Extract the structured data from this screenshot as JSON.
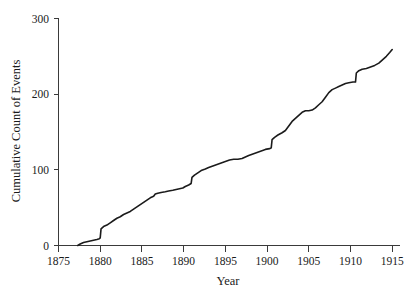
{
  "chart_data": {
    "type": "line",
    "title": "",
    "subtitle": "",
    "xlabel": "Year",
    "ylabel": "Cumulative Count of Events",
    "xlim": [
      1874.0,
      1916.2
    ],
    "ylim": [
      -8,
      305
    ],
    "xticks": [
      1875,
      1880,
      1885,
      1890,
      1895,
      1900,
      1905,
      1910,
      1915
    ],
    "yticks": [
      0,
      100,
      200,
      300
    ],
    "xtick_labels": [
      "1875",
      "1880",
      "1885",
      "1890",
      "1895",
      "1900",
      "1905",
      "1910",
      "1915"
    ],
    "ytick_labels": [
      "0",
      "100",
      "200",
      "300"
    ],
    "grid": false,
    "legend": false,
    "legend_position": "none",
    "line_color": "#1b1b1b",
    "series": [
      {
        "name": "Cumulative Count of Events",
        "x": [
          1877.3,
          1877.6,
          1878.0,
          1878.4,
          1878.8,
          1879.2,
          1879.6,
          1879.9,
          1880.0,
          1880.1,
          1880.4,
          1880.8,
          1881.2,
          1881.6,
          1882.0,
          1882.4,
          1882.8,
          1883.2,
          1883.6,
          1884.0,
          1884.4,
          1884.8,
          1885.2,
          1885.6,
          1886.0,
          1886.4,
          1886.6,
          1886.9,
          1887.3,
          1887.8,
          1888.2,
          1888.7,
          1889.1,
          1889.5,
          1889.9,
          1890.2,
          1890.6,
          1890.9,
          1891.0,
          1891.3,
          1891.7,
          1892.1,
          1892.6,
          1893.0,
          1893.5,
          1894.0,
          1894.5,
          1895.0,
          1895.5,
          1896.0,
          1896.5,
          1897.0,
          1897.4,
          1897.8,
          1898.3,
          1898.8,
          1899.3,
          1899.8,
          1900.3,
          1900.5,
          1900.6,
          1900.9,
          1901.3,
          1901.8,
          1902.2,
          1902.6,
          1903.0,
          1903.4,
          1903.8,
          1904.2,
          1904.6,
          1905.0,
          1905.4,
          1905.8,
          1906.2,
          1906.6,
          1907.0,
          1907.4,
          1907.8,
          1908.2,
          1908.6,
          1909.0,
          1909.4,
          1909.8,
          1910.3,
          1910.6,
          1910.7,
          1911.0,
          1911.4,
          1911.9,
          1912.4,
          1912.9,
          1913.4,
          1913.9,
          1914.3,
          1914.7,
          1915.0
        ],
        "y": [
          0,
          2,
          4,
          5,
          6,
          7,
          8,
          9,
          10,
          22,
          25,
          27,
          30,
          33,
          36,
          38,
          41,
          43,
          45,
          48,
          51,
          54,
          57,
          60,
          63,
          65,
          68,
          69,
          70,
          71,
          72,
          73,
          74,
          75,
          76,
          78,
          80,
          82,
          90,
          93,
          96,
          99,
          101,
          103,
          105,
          107,
          109,
          111,
          113,
          114,
          114,
          115,
          117,
          119,
          121,
          123,
          125,
          127,
          128,
          129,
          140,
          143,
          146,
          149,
          152,
          158,
          164,
          168,
          172,
          176,
          178,
          178,
          179,
          182,
          186,
          190,
          196,
          202,
          206,
          208,
          210,
          212,
          214,
          215,
          216,
          216,
          228,
          231,
          233,
          234,
          236,
          238,
          241,
          246,
          250,
          255,
          259
        ]
      }
    ]
  },
  "axis": {
    "x_title": "Year",
    "y_title": "Cumulative Count of Events"
  }
}
